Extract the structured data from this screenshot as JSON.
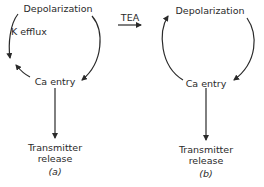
{
  "diagram": {
    "panel_a": {
      "top_node": "Depolarization",
      "side_label": "K efflux",
      "bottom_node": "Ca entry",
      "output_line1": "Transmitter",
      "output_line2": "release",
      "caption": "(a)"
    },
    "transition": {
      "label": "TEA"
    },
    "panel_b": {
      "top_node": "Depolarization",
      "bottom_node": "Ca entry",
      "output_line1": "Transmitter",
      "output_line2": "release",
      "caption": "(b)"
    },
    "colors": {
      "ink": "#2a2a2a",
      "background": "#ffffff"
    }
  }
}
